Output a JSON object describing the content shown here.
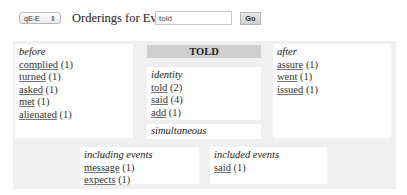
{
  "toolbar": {
    "select_value": "qE-E",
    "select_arrows": "⇕",
    "title": "Orderings for Event",
    "search_value": "told",
    "go_label": "Go"
  },
  "event": {
    "title": "TOLD"
  },
  "before": {
    "label": "before",
    "items": [
      {
        "word": "complied",
        "count": "(1)"
      },
      {
        "word": "turned",
        "count": "(1)"
      },
      {
        "word": "asked",
        "count": "(1)"
      },
      {
        "word": "met",
        "count": "(1)"
      },
      {
        "word": "alienated",
        "count": "(1)"
      }
    ]
  },
  "identity": {
    "label": "identity",
    "items": [
      {
        "word": "told",
        "count": "(2)"
      },
      {
        "word": "said",
        "count": "(4)"
      },
      {
        "word": "add",
        "count": "(1)"
      }
    ]
  },
  "simultaneous": {
    "label": "simultaneous"
  },
  "after": {
    "label": "after",
    "items": [
      {
        "word": "assure",
        "count": "(1)"
      },
      {
        "word": "went",
        "count": "(1)"
      },
      {
        "word": "issued",
        "count": "(1)"
      }
    ]
  },
  "including": {
    "label": "including events",
    "items": [
      {
        "word": "message",
        "count": "(1)"
      },
      {
        "word": "expects",
        "count": "(1)"
      }
    ]
  },
  "included": {
    "label": "included events",
    "items": [
      {
        "word": "said",
        "count": "(1)"
      }
    ]
  }
}
